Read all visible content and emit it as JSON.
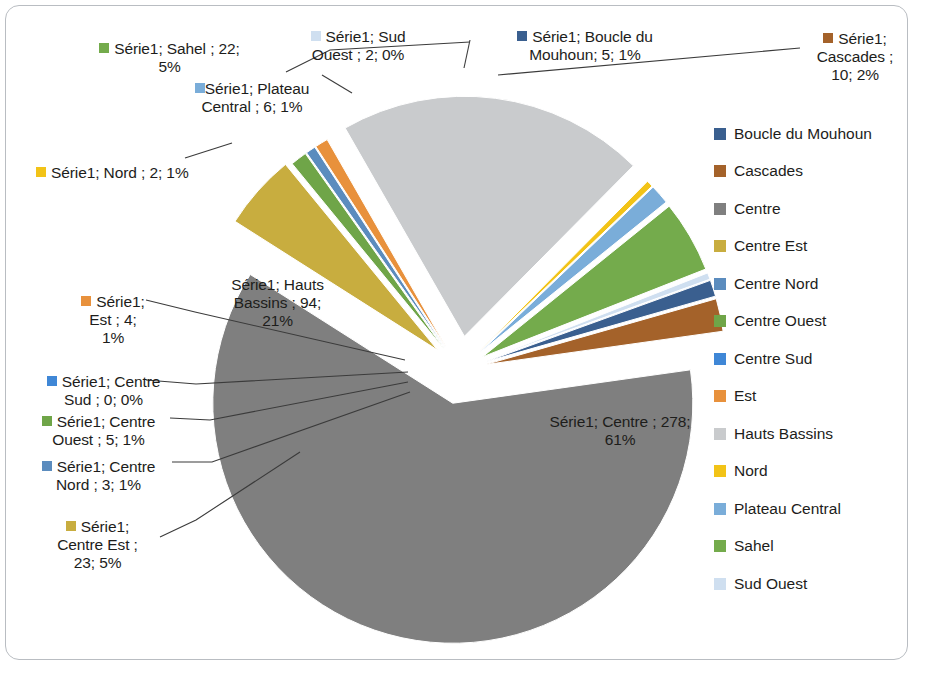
{
  "chart_data": {
    "type": "pie",
    "title": "",
    "series_name": "Série1",
    "total": 452,
    "legend_position": "right",
    "grid": false,
    "categories": [
      "Boucle du Mouhoun",
      "Cascades",
      "Centre",
      "Centre Est",
      "Centre Nord",
      "Centre Ouest",
      "Centre Sud",
      "Est",
      "Hauts Bassins",
      "Nord",
      "Plateau Central",
      "Sahel",
      "Sud Ouest"
    ],
    "values": [
      5,
      10,
      278,
      23,
      3,
      5,
      0,
      4,
      94,
      2,
      6,
      22,
      2
    ],
    "percents": [
      "1%",
      "2%",
      "61%",
      "5%",
      "1%",
      "1%",
      "0%",
      "1%",
      "21%",
      "1%",
      "1%",
      "5%",
      "0%"
    ],
    "colors": [
      "#3a5f8f",
      "#a4622a",
      "#7f7f7f",
      "#c8ad3f",
      "#5b8cbe",
      "#6fa548",
      "#3f87d6",
      "#e8913c",
      "#c9cbcd",
      "#f2c317",
      "#7aadd9",
      "#74ab4c",
      "#cfdff0"
    ]
  },
  "legend": {
    "items": [
      {
        "label": "Boucle du Mouhoun",
        "color": "#3a5f8f"
      },
      {
        "label": "Cascades",
        "color": "#a4622a"
      },
      {
        "label": "Centre",
        "color": "#7f7f7f"
      },
      {
        "label": "Centre Est",
        "color": "#c8ad3f"
      },
      {
        "label": "Centre Nord",
        "color": "#5b8cbe"
      },
      {
        "label": "Centre Ouest",
        "color": "#6fa548"
      },
      {
        "label": "Centre Sud",
        "color": "#3f87d6"
      },
      {
        "label": "Est",
        "color": "#e8913c"
      },
      {
        "label": "Hauts Bassins",
        "color": "#c9cbcd"
      },
      {
        "label": "Nord",
        "color": "#f2c317"
      },
      {
        "label": "Plateau Central",
        "color": "#7aadd9"
      },
      {
        "label": "Sahel",
        "color": "#74ab4c"
      },
      {
        "label": "Sud Ouest",
        "color": "#cfdff0"
      }
    ]
  },
  "data_labels": {
    "sahel": "Série1; Sahel ; 22;\n5%",
    "sud_ouest": "Série1; Sud\nOuest ; 2; 0%",
    "boucle_du_mouhoun": "Série1; Boucle du\nMouhoun; 5; 1%",
    "cascades": "Série1;\nCascades ;\n10; 2%",
    "plateau_central": "Série1; Plateau\nCentral ; 6; 1%",
    "nord": "Série1; Nord ; 2; 1%",
    "hauts_bassins": "Série1; Hauts\nBassins ; 94;\n21%",
    "est": "Série1;\nEst ; 4;\n1%",
    "centre_sud": "Série1; Centre\nSud ; 0; 0%",
    "centre_ouest": "Série1; Centre\nOuest ; 5; 1%",
    "centre_nord": "Série1; Centre\nNord ; 3; 1%",
    "centre_est": "Série1;\nCentre Est ;\n23; 5%",
    "centre": "Série1; Centre ; 278;\n61%"
  }
}
